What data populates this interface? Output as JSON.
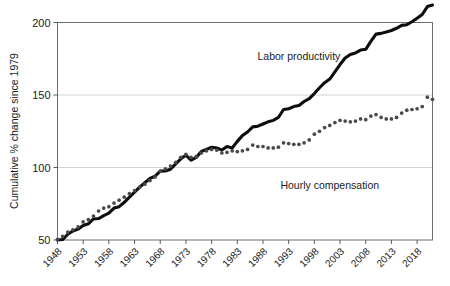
{
  "chart_data": {
    "type": "line",
    "title": "",
    "xlabel": "",
    "ylabel": "Cumulative % change since 1979",
    "ylim": [
      50,
      200
    ],
    "xlim": [
      1948,
      2021
    ],
    "yticks": [
      50,
      100,
      150,
      200
    ],
    "ytick_labels": [
      "50",
      "100",
      "150",
      "200"
    ],
    "xticks": [
      1948,
      1953,
      1958,
      1963,
      1968,
      1973,
      1978,
      1983,
      1988,
      1993,
      1998,
      2003,
      2008,
      2013,
      2018
    ],
    "xtick_labels": [
      "1948",
      "1953",
      "1958",
      "1963",
      "1968",
      "1973",
      "1978",
      "1983",
      "1988",
      "1993",
      "1998",
      "2003",
      "2008",
      "2013",
      "2018"
    ],
    "grid": true,
    "grid_axis": "y",
    "legend_position": "inline-annotations",
    "annotations": [
      {
        "name": "labor-productivity-label",
        "text": "Labor productivity",
        "x": 1995,
        "y": 174
      },
      {
        "name": "hourly-compensation-label",
        "text": "Hourly compensation",
        "x": 2001,
        "y": 85
      }
    ],
    "x": [
      1948,
      1949,
      1950,
      1951,
      1952,
      1953,
      1954,
      1955,
      1956,
      1957,
      1958,
      1959,
      1960,
      1961,
      1962,
      1963,
      1964,
      1965,
      1966,
      1967,
      1968,
      1969,
      1970,
      1971,
      1972,
      1973,
      1974,
      1975,
      1976,
      1977,
      1978,
      1979,
      1980,
      1981,
      1982,
      1983,
      1984,
      1985,
      1986,
      1987,
      1988,
      1989,
      1990,
      1991,
      1992,
      1993,
      1994,
      1995,
      1996,
      1997,
      1998,
      1999,
      2000,
      2001,
      2002,
      2003,
      2004,
      2005,
      2006,
      2007,
      2008,
      2009,
      2010,
      2011,
      2012,
      2013,
      2014,
      2015,
      2016,
      2017,
      2018,
      2019,
      2020,
      2021
    ],
    "series": [
      {
        "name": "Labor productivity",
        "style": "solid-thick-black",
        "color": "#0d0d0d",
        "values": [
          50.0,
          50.3,
          54.0,
          56.2,
          57.5,
          60.0,
          61.2,
          64.5,
          64.8,
          66.8,
          68.5,
          72.0,
          73.0,
          76.0,
          79.5,
          83.0,
          86.5,
          89.5,
          92.5,
          94.0,
          97.5,
          97.6,
          98.8,
          102.5,
          106.0,
          108.5,
          105.0,
          107.0,
          111.0,
          112.5,
          114.0,
          113.5,
          112.0,
          114.5,
          113.5,
          118.0,
          122.0,
          124.5,
          128.0,
          128.5,
          130.0,
          131.5,
          132.5,
          134.5,
          140.0,
          140.5,
          142.0,
          142.8,
          145.5,
          147.5,
          151.0,
          155.0,
          158.5,
          161.0,
          166.0,
          171.0,
          175.5,
          178.0,
          179.0,
          181.0,
          181.5,
          187.0,
          192.0,
          192.5,
          193.5,
          194.5,
          196.0,
          198.0,
          198.5,
          200.5,
          203.0,
          205.5,
          211.0,
          212.0
        ]
      },
      {
        "name": "Hourly compensation",
        "style": "dotted",
        "color": "#4a4a4a",
        "values": [
          50.5,
          52.5,
          55.5,
          57.0,
          59.0,
          62.5,
          64.0,
          66.5,
          70.0,
          72.0,
          73.0,
          75.5,
          77.5,
          79.5,
          82.0,
          84.0,
          86.5,
          88.5,
          91.0,
          93.5,
          97.5,
          99.0,
          101.0,
          103.5,
          107.0,
          109.0,
          107.0,
          107.5,
          110.0,
          111.5,
          112.5,
          112.0,
          110.0,
          110.5,
          111.5,
          111.0,
          111.5,
          112.5,
          115.5,
          114.5,
          114.5,
          113.5,
          113.5,
          114.0,
          117.0,
          116.5,
          116.0,
          116.0,
          117.0,
          119.0,
          123.0,
          125.0,
          127.5,
          129.0,
          131.0,
          132.5,
          132.0,
          131.5,
          132.0,
          133.5,
          133.0,
          135.5,
          136.5,
          134.5,
          133.5,
          133.5,
          134.5,
          137.5,
          139.5,
          140.0,
          140.5,
          142.0,
          148.5,
          147.0
        ]
      }
    ]
  }
}
